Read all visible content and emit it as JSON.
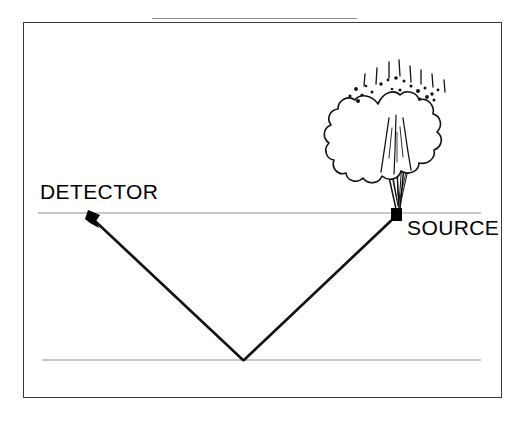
{
  "caption": {
    "figure_number": "Figure 5.1.",
    "title": "Seismic Survey"
  },
  "diagram": {
    "labels": {
      "detector": "DETECTOR",
      "source": "SOURCE"
    },
    "colors": {
      "ray_path": "#111111",
      "interface_line": "#b4b4b4",
      "frame_border": "#3a3a3a",
      "explosion_outline": "#111111",
      "marker_fill": "#000000",
      "text": "#000000"
    },
    "geometry": {
      "surface_line_y": 213,
      "surface_line_x_start": 38,
      "surface_line_x_end": 481,
      "reflector_line_y": 360,
      "reflector_line_x_start": 42,
      "reflector_line_x_end": 481,
      "source_point_x": 397,
      "source_point_y": 213,
      "detector_point_x": 92,
      "detector_point_y": 216,
      "reflection_point_x": 243,
      "reflection_point_y": 360
    }
  }
}
